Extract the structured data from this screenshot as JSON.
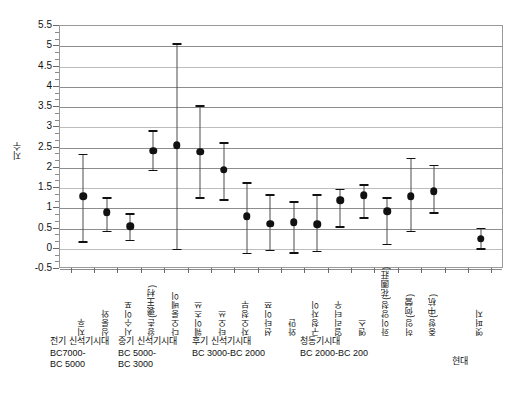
{
  "chart_data": {
    "type": "scatter",
    "title": "",
    "xlabel": "",
    "ylabel": "지수",
    "ylim": [
      -0.5,
      5.5
    ],
    "ytick_step": 0.5,
    "yticks": [
      "5.5",
      "5",
      "4.5",
      "4",
      "3.5",
      "3",
      "2.5",
      "2",
      "1.5",
      "1",
      "0.5",
      "0",
      "-0.5"
    ],
    "grid": true,
    "legend": "none",
    "minor_ticks": true,
    "error_bars": "vertical-with-caps",
    "categories": [
      "지후",
      "싱룽와",
      "시수이포",
      "왕촌(褒王村)",
      "다오룽베이",
      "웨이츠쓰",
      "타오쓰",
      "자오청부",
      "션타이쯔",
      "와먄",
      "구청자이",
      "얼리터우",
      "옌스",
      "화이양청(花園莊)",
      "허잉(何營)",
      "중항(中杭)",
      "",
      "옛퍼지"
    ],
    "values": [
      1.3,
      0.9,
      0.55,
      2.42,
      2.55,
      2.4,
      1.95,
      0.8,
      0.62,
      0.65,
      0.6,
      1.2,
      1.32,
      0.92,
      1.3,
      1.42,
      null,
      0.25
    ],
    "upper": [
      2.35,
      1.27,
      0.88,
      2.92,
      5.08,
      3.55,
      2.63,
      1.65,
      1.35,
      1.18,
      1.35,
      1.48,
      1.6,
      1.28,
      2.25,
      2.08,
      null,
      0.52
    ],
    "lower": [
      0.18,
      0.45,
      0.22,
      1.95,
      0.0,
      1.28,
      1.23,
      -0.1,
      -0.02,
      -0.08,
      -0.05,
      0.55,
      0.78,
      0.12,
      0.45,
      0.9,
      null,
      0.02
    ]
  },
  "chart": {
    "y_axis_title": "지수"
  },
  "periods": [
    {
      "name": "전기 신석기시대",
      "range_line1": "BC7000-",
      "range_line2": "BC 5000"
    },
    {
      "name": "중기 신석기시대",
      "range_line1": "BC 5000-",
      "range_line2": "BC 3000"
    },
    {
      "name": "후기 신석기시대",
      "range_line1": "BC 3000-BC 2000",
      "range_line2": ""
    },
    {
      "name": "청동기시대",
      "range_line1": "BC 2000-BC 200",
      "range_line2": ""
    },
    {
      "name": "현대",
      "range_line1": "",
      "range_line2": ""
    }
  ]
}
